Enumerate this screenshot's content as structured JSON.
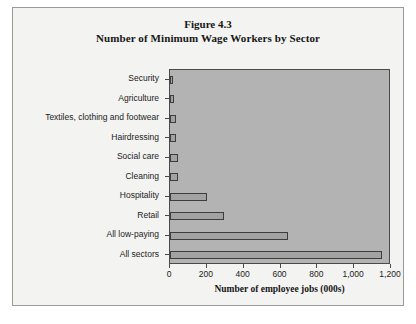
{
  "figure": {
    "title_line1": "Figure 4.3",
    "title_line2": "Number of Minimum Wage Workers by Sector"
  },
  "chart_data": {
    "type": "bar",
    "orientation": "horizontal",
    "title": "Number of Minimum Wage Workers by Sector",
    "subtitle": "Figure 4.3",
    "xlabel": "Number of employee jobs (000s)",
    "ylabel": "",
    "xlim": [
      0,
      1200
    ],
    "xticks": [
      0,
      200,
      400,
      600,
      800,
      1000,
      1200
    ],
    "xticklabels": [
      "0",
      "200",
      "400",
      "600",
      "800",
      "1,000",
      "1,200"
    ],
    "grid": false,
    "legend": null,
    "categories": [
      "Security",
      "Agriculture",
      "Textiles, clothing and footwear",
      "Hairdressing",
      "Social care",
      "Cleaning",
      "Hospitality",
      "Retail",
      "All low-paying",
      "All sectors"
    ],
    "values": [
      15,
      20,
      30,
      30,
      45,
      45,
      200,
      295,
      640,
      1150
    ],
    "plot_background": "#b3b3b3",
    "bar_fill": "#a2a2a2",
    "bar_border": "#3d3d3d"
  }
}
